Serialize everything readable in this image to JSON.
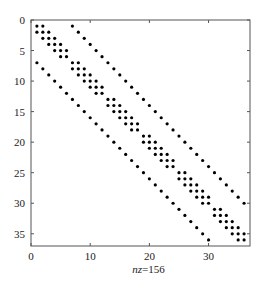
{
  "chart_data": {
    "type": "scatter",
    "subtype": "sparsity-pattern (spy plot)",
    "title": "",
    "xlabel": "nz=156",
    "xlabel_parts": {
      "italic": "nz",
      "rest": "=156"
    },
    "ylabel": "",
    "xlim": [
      0,
      37
    ],
    "ylim": [
      37,
      0
    ],
    "y_inverted": true,
    "xticks": [
      0,
      10,
      20,
      30
    ],
    "yticks": [
      0,
      5,
      10,
      15,
      20,
      25,
      30,
      35
    ],
    "grid": false,
    "legend": null,
    "matrix_size": [
      36,
      36
    ],
    "nnz": 156,
    "structure": {
      "block_size": 6,
      "num_blocks": 6,
      "diagonal_blocks": "tridiagonal (offsets -1, 0, +1 within each 6x6 block)",
      "off_diagonals": [
        -6,
        6
      ]
    },
    "marker": {
      "shape": "circle",
      "color": "#000000",
      "radius": 1.6
    }
  },
  "colors": {
    "background": "#ffffff",
    "axes": "#555555",
    "markers": "#000000",
    "text": "#222222"
  }
}
